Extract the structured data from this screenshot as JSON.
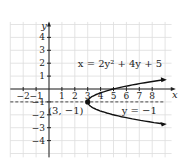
{
  "chart_data": {
    "type": "line",
    "title": "",
    "xlabel": "x",
    "ylabel": "y",
    "xlim": [
      -3,
      9.5
    ],
    "ylim": [
      -5,
      5
    ],
    "grid": true,
    "x_ticks": [
      "-2",
      "-1",
      "1",
      "2",
      "3",
      "4",
      "5",
      "6",
      "7",
      "8"
    ],
    "y_ticks": [
      "4",
      "3",
      "2",
      "1",
      "-1",
      "-2",
      "-3",
      "-4"
    ],
    "series": [
      {
        "name": "x = 2y^2 + 4y + 5",
        "type": "parabola",
        "vertex": [
          3,
          -1
        ],
        "opens": "right"
      },
      {
        "name": "y = -1",
        "type": "dashed-line",
        "y": -1
      }
    ],
    "annotations": [
      {
        "text": "x = 2y² + 4y + 5",
        "x": 5.5,
        "y": 2
      },
      {
        "text": "(3, −1)",
        "x": 1.3,
        "y": -1.6
      },
      {
        "text": "y = −1",
        "x": 7.0,
        "y": -1.6
      }
    ],
    "points": [
      {
        "x": 3,
        "y": -1,
        "label": "(3, −1)"
      }
    ]
  },
  "labels": {
    "x_axis": "x",
    "y_axis": "y",
    "equation": "x = 2y² + 4y + 5",
    "vertex": "(3, −1)",
    "axis_of_symmetry": "y = −1"
  }
}
